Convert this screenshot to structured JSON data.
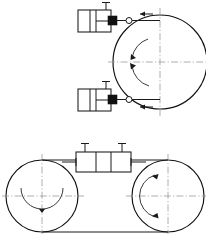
{
  "document": {
    "title": "Pneumatic Cylinder Drum Clamp Assembly Drawing",
    "drawing_type": "orthographic-technical-drawing",
    "background_color": "#ffffff",
    "line_color": "#111111",
    "centerline_color": "#9a9a9a"
  },
  "caption": {
    "text": "",
    "note": "bottom caption strip is cropped and illegible"
  },
  "views": {
    "top_view": {
      "name": "front-elevation-view",
      "drum": {
        "name": "main-drum",
        "cx": 160,
        "cy": 62,
        "r": 47
      },
      "centerlines": {
        "horizontal_label": "horizontal-centerline",
        "vertical_label": "vertical-centerline"
      },
      "rotation_indicators": [
        {
          "name": "rotation-arc-upper"
        },
        {
          "name": "rotation-arc-lower"
        }
      ],
      "cylinders": [
        {
          "name": "upper-pneumatic-cylinder",
          "body_x": 78,
          "body_y": 10,
          "body_w": 33,
          "body_h": 22,
          "port_label": "air-port",
          "rod_label": "piston-rod",
          "joint_label": "rod-end-joint",
          "flow_arrow": "left"
        },
        {
          "name": "lower-pneumatic-cylinder",
          "body_x": 78,
          "body_y": 89,
          "body_w": 33,
          "body_h": 22,
          "port_label": "air-port",
          "rod_label": "piston-rod",
          "joint_label": "rod-end-joint",
          "flow_arrow": "left"
        }
      ]
    },
    "bottom_view": {
      "name": "plan-view",
      "drums": [
        {
          "name": "left-drum",
          "cx": 42,
          "cy": 196,
          "r": 36
        },
        {
          "name": "right-drum",
          "cx": 168,
          "cy": 196,
          "r": 36
        }
      ],
      "tangent_lines": [
        {
          "name": "upper-tangent-line"
        },
        {
          "name": "lower-tangent-line"
        }
      ],
      "center_cylinder": {
        "name": "center-pneumatic-cylinder",
        "body_x": 76,
        "body_y": 152,
        "body_w": 55,
        "body_h": 20,
        "ports": [
          "air-port-left",
          "air-port-right"
        ],
        "rod_label": "connecting-rod"
      },
      "rotation_indicators": [
        {
          "name": "rotation-arc-left-drum"
        },
        {
          "name": "rotation-arc-right-drum"
        }
      ]
    }
  }
}
